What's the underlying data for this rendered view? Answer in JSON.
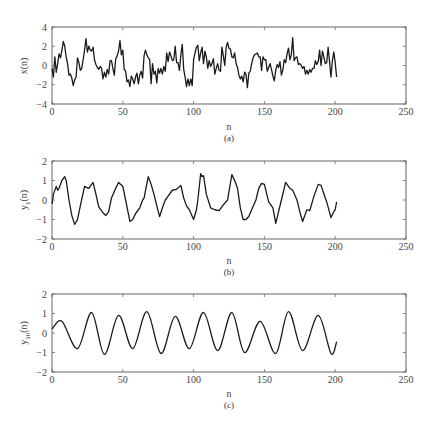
{
  "chart_data": [
    {
      "type": "line",
      "panel": "a",
      "caption": "(a)",
      "title": "",
      "xlabel": "n",
      "ylabel": "x(n)",
      "xlim": [
        0,
        250
      ],
      "ylim": [
        -4,
        4
      ],
      "xticks": [
        0,
        50,
        100,
        150,
        200,
        250
      ],
      "yticks": [
        -4,
        -2,
        0,
        2,
        4
      ],
      "grid": false,
      "series": [
        {
          "name": "x(n)",
          "x": [
            0,
            1,
            2,
            3,
            4,
            5,
            6,
            7,
            8,
            9,
            10,
            11,
            12,
            13,
            14,
            15,
            16,
            17,
            18,
            19,
            20,
            21,
            22,
            23,
            24,
            25,
            26,
            27,
            28,
            29,
            30,
            31,
            32,
            33,
            34,
            35,
            36,
            37,
            38,
            39,
            40,
            41,
            42,
            43,
            44,
            45,
            46,
            47,
            48,
            49,
            50,
            51,
            52,
            53,
            54,
            55,
            56,
            57,
            58,
            59,
            60,
            61,
            62,
            63,
            64,
            65,
            66,
            67,
            68,
            69,
            70,
            71,
            72,
            73,
            74,
            75,
            76,
            77,
            78,
            79,
            80,
            81,
            82,
            83,
            84,
            85,
            86,
            87,
            88,
            89,
            90,
            91,
            92,
            93,
            94,
            95,
            96,
            97,
            98,
            99,
            100,
            101,
            102,
            103,
            104,
            105,
            106,
            107,
            108,
            109,
            110,
            111,
            112,
            113,
            114,
            115,
            116,
            117,
            118,
            119,
            120,
            121,
            122,
            123,
            124,
            125,
            126,
            127,
            128,
            129,
            130,
            131,
            132,
            133,
            134,
            135,
            136,
            137,
            138,
            139,
            140,
            141,
            142,
            143,
            144,
            145,
            146,
            147,
            148,
            149,
            150,
            151,
            152,
            153,
            154,
            155,
            156,
            157,
            158,
            159,
            160,
            161,
            162,
            163,
            164,
            165,
            166,
            167,
            168,
            169,
            170,
            171,
            172,
            173,
            174,
            175,
            176,
            177,
            178,
            179,
            180,
            181,
            182,
            183,
            184,
            185,
            186,
            187,
            188,
            189,
            190,
            191,
            192,
            193,
            194,
            195,
            196,
            197,
            198,
            199,
            200,
            201
          ],
          "values": [
            -0.3,
            -1.2,
            0.9,
            -0.7,
            0.2,
            1.2,
            0.8,
            1.6,
            2.5,
            2.0,
            0.9,
            0.2,
            -1.0,
            -0.9,
            -1.3,
            -2.1,
            -1.5,
            -1.2,
            0.8,
            0.3,
            -0.5,
            -0.3,
            0.6,
            1.6,
            2.8,
            1.4,
            2.0,
            1.6,
            1.5,
            1.9,
            0.6,
            0.1,
            -0.2,
            -0.4,
            -0.1,
            -0.3,
            -1.4,
            -0.7,
            -1.2,
            -0.4,
            -0.9,
            0.5,
            0.5,
            -0.3,
            -1.0,
            0.7,
            1.0,
            1.5,
            2.6,
            1.1,
            1.6,
            -0.4,
            -0.6,
            -1.7,
            -1.5,
            -2.2,
            -1.1,
            -1.4,
            -1.9,
            -1.2,
            -0.8,
            -1.9,
            -1.0,
            -0.6,
            -1.3,
            1.0,
            1.6,
            1.1,
            0.8,
            0.6,
            -1.9,
            0.2,
            -0.9,
            -0.6,
            -1.8,
            -0.3,
            -0.8,
            -0.3,
            -0.9,
            -0.1,
            -0.6,
            1.3,
            0.4,
            1.4,
            1.0,
            0.5,
            0.6,
            2.0,
            0.3,
            0.3,
            -0.5,
            1.1,
            2.2,
            -0.4,
            -1.2,
            -2.2,
            -1.4,
            -2.1,
            -1.4,
            -2.1,
            0.6,
            1.3,
            1.9,
            2.1,
            0.5,
            1.3,
            1.9,
            0.2,
            1.5,
            0.9,
            -0.3,
            0.5,
            -0.1,
            0.2,
            0.7,
            -0.9,
            -0.3,
            0.2,
            -0.5,
            -0.6,
            1.9,
            1.0,
            0.0,
            1.9,
            2.4,
            1.8,
            1.7,
            0.9,
            0.8,
            1.3,
            0.2,
            -0.2,
            -1.0,
            -1.4,
            -1.1,
            -1.7,
            -0.7,
            -0.9,
            -2.3,
            -0.8,
            -0.6,
            0.2,
            0.8,
            1.1,
            1.2,
            1.3,
            0.9,
            0.9,
            -0.5,
            0.9,
            0.6,
            0.6,
            -0.6,
            -0.2,
            0.2,
            -0.4,
            -1.1,
            -1.6,
            -0.5,
            0.1,
            -0.2,
            0.4,
            -1.0,
            -0.5,
            0.6,
            0.3,
            1.2,
            1.8,
            0.6,
            1.1,
            2.9,
            0.5,
            0.8,
            0.9,
            0.1,
            0.2,
            0.0,
            -0.3,
            -0.1,
            -0.9,
            -0.5,
            -0.9,
            -0.4,
            -0.7,
            -0.3,
            -0.3,
            0.5,
            0.1,
            0.4,
            1.6,
            0.0,
            1.5,
            0.9,
            0.2,
            0.3,
            1.9,
            0.4,
            -1.2,
            0.5,
            1.4,
            0.3,
            -1.2,
            -0.2,
            0.6,
            -1.4,
            0.5,
            0.1
          ]
        }
      ]
    },
    {
      "type": "line",
      "panel": "b",
      "caption": "(b)",
      "title": "",
      "xlabel": "n",
      "ylabel": "y1(n)",
      "xlim": [
        0,
        250
      ],
      "ylim": [
        -2,
        2
      ],
      "xticks": [
        0,
        50,
        100,
        150,
        200,
        250
      ],
      "yticks": [
        -2,
        -1,
        0,
        1,
        2
      ],
      "grid": false,
      "series": [
        {
          "name": "y1(n)",
          "x": [
            0,
            1,
            3,
            4,
            5,
            7,
            9,
            10,
            12,
            14,
            16,
            18,
            20,
            23,
            26,
            29,
            31,
            33,
            36,
            38,
            40,
            42,
            45,
            47,
            50,
            52,
            55,
            57,
            59,
            61,
            62,
            64,
            65,
            68,
            70,
            72,
            74,
            76,
            78,
            80,
            82,
            85,
            88,
            91,
            93,
            95,
            97,
            100,
            102,
            103,
            105,
            106,
            107,
            109,
            112,
            115,
            118,
            121,
            124,
            127,
            129,
            131,
            133,
            135,
            137,
            139,
            141,
            144,
            146,
            148,
            150,
            153,
            156,
            158,
            160,
            162,
            165,
            168,
            170,
            173,
            175,
            177,
            180,
            182,
            185,
            188,
            190,
            193,
            194,
            197,
            199,
            200,
            201
          ],
          "values": [
            -0.2,
            0.3,
            0.7,
            0.5,
            0.6,
            1.0,
            1.2,
            1.0,
            0.0,
            -0.8,
            -1.25,
            -1.0,
            -0.3,
            0.7,
            0.6,
            0.9,
            0.3,
            -0.35,
            -0.65,
            -0.8,
            -0.6,
            0.1,
            0.6,
            0.9,
            0.7,
            0.0,
            -1.1,
            -1.0,
            -0.7,
            -0.5,
            -0.4,
            0.0,
            0.1,
            1.2,
            0.8,
            0.3,
            -0.3,
            -0.85,
            -0.4,
            0.0,
            0.2,
            0.5,
            0.55,
            0.75,
            0.1,
            -0.3,
            -0.5,
            -1.0,
            -0.5,
            0.0,
            1.35,
            1.2,
            1.25,
            0.3,
            -0.4,
            -0.5,
            -0.55,
            -0.25,
            0.0,
            1.3,
            1.0,
            0.6,
            -0.4,
            -1.0,
            -1.0,
            -0.85,
            -0.5,
            0.0,
            0.6,
            0.85,
            0.8,
            -0.1,
            -0.4,
            -1.2,
            -0.6,
            0.0,
            0.9,
            0.6,
            0.5,
            0.0,
            -0.6,
            -1.1,
            -0.5,
            -0.55,
            0.2,
            0.8,
            0.75,
            0.1,
            -0.1,
            -0.9,
            -0.6,
            -0.5,
            -0.1
          ]
        }
      ]
    },
    {
      "type": "line",
      "panel": "c",
      "caption": "(c)",
      "title": "",
      "xlabel": "n",
      "ylabel": "y10(n)",
      "xlim": [
        0,
        250
      ],
      "ylim": [
        -2,
        2
      ],
      "xticks": [
        0,
        50,
        100,
        150,
        200,
        250
      ],
      "yticks": [
        -2,
        -1,
        0,
        1,
        2
      ],
      "grid": false,
      "series": [
        {
          "name": "y10(n)",
          "x": [
            0,
            7,
            18,
            28,
            37,
            47,
            57,
            67,
            77,
            87,
            97,
            107,
            117,
            127,
            136,
            147,
            158,
            167,
            177,
            188,
            197,
            201
          ],
          "values": [
            0.2,
            0.6,
            -0.8,
            1.05,
            -1.1,
            0.9,
            -0.8,
            1.1,
            -1.05,
            0.85,
            -0.8,
            1.05,
            -0.9,
            1.05,
            -1.0,
            0.6,
            -1.05,
            1.1,
            -0.9,
            0.9,
            -1.05,
            -0.45
          ]
        }
      ]
    }
  ],
  "panels": [
    {
      "ylabel_main": "x(n)",
      "ylabel_sub": "",
      "ylabel_tail": "",
      "xlabel": "n",
      "caption": "(a)",
      "xtick_labels": [
        "0",
        "50",
        "100",
        "150",
        "200",
        "250"
      ],
      "ytick_labels": [
        "4",
        "2",
        "0",
        "−2",
        "−4"
      ]
    },
    {
      "ylabel_main": "y",
      "ylabel_sub": "1",
      "ylabel_tail": "(n)",
      "xlabel": "n",
      "caption": "(b)",
      "xtick_labels": [
        "0",
        "50",
        "100",
        "150",
        "200",
        "250"
      ],
      "ytick_labels": [
        "2",
        "1",
        "0",
        "−1",
        "−2"
      ]
    },
    {
      "ylabel_main": "y",
      "ylabel_sub": "10",
      "ylabel_tail": "(n)",
      "xlabel": "n",
      "caption": "(c)",
      "xtick_labels": [
        "0",
        "50",
        "100",
        "150",
        "200",
        "250"
      ],
      "ytick_labels": [
        "2",
        "1",
        "0",
        "−1",
        "−2"
      ]
    }
  ],
  "style": {
    "trace_color": "#1a1a1a",
    "axis_color": "#666666",
    "text_color": "#444444"
  }
}
